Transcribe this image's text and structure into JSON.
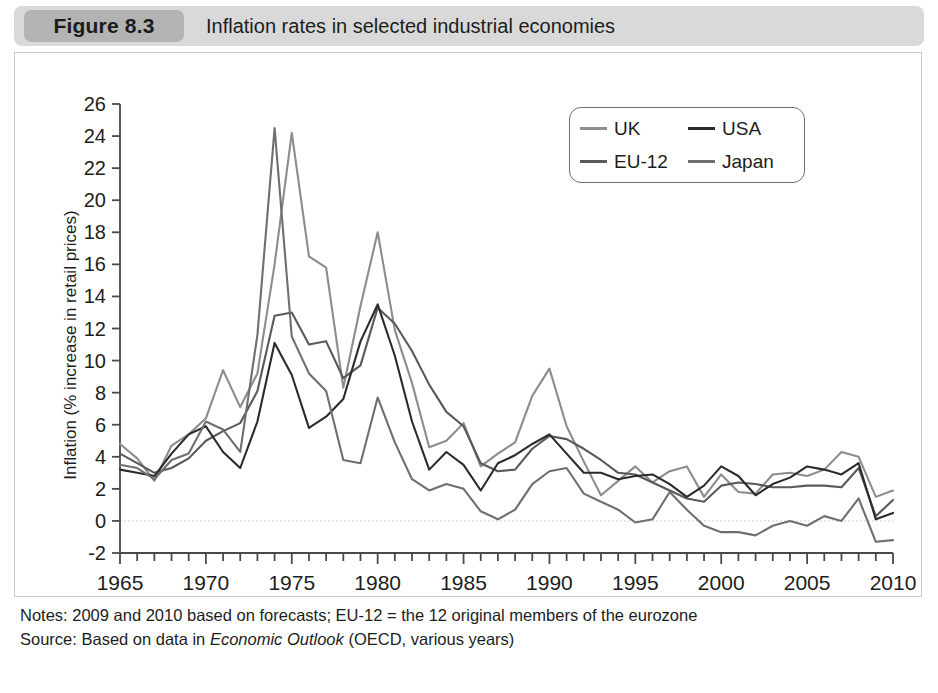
{
  "header": {
    "badge": "Figure 8.3",
    "title": "Inflation rates in selected industrial economies"
  },
  "footnotes": {
    "notes_prefix": "Notes: 2009 and 2010 based on forecasts; EU-12 = the 12 original members of the eurozone",
    "source_prefix": "Source: Based on data in ",
    "source_italic": "Economic Outlook",
    "source_suffix": " (OECD, various years)"
  },
  "colors": {
    "uk": "#8c8c8c",
    "eu12": "#595959",
    "usa": "#2b2b2b",
    "japan": "#6f6f6f",
    "axis": "#4a4a4a",
    "zero_gridline": "#cfcfcf",
    "panel_border": "#c9c9c9",
    "header_bar": "#d9d9d9",
    "badge": "#b3b3b3"
  },
  "chart_data": {
    "type": "line",
    "title": "Inflation rates in selected industrial economies",
    "xlabel": "",
    "ylabel": "Inflation (% increase in retail prices)",
    "xlim": [
      1965,
      2010
    ],
    "ylim": [
      -2,
      26
    ],
    "ytick_step": 2,
    "yticks": [
      -2,
      0,
      2,
      4,
      6,
      8,
      10,
      12,
      14,
      16,
      18,
      20,
      22,
      24,
      26
    ],
    "xticks_labeled": [
      1965,
      1970,
      1975,
      1980,
      1985,
      1990,
      1995,
      2000,
      2005,
      2010
    ],
    "xtick_minor_step": 1,
    "grid": "zero-line-only",
    "legend_position": "top-right",
    "x": [
      1965,
      1966,
      1967,
      1968,
      1969,
      1970,
      1971,
      1972,
      1973,
      1974,
      1975,
      1976,
      1977,
      1978,
      1979,
      1980,
      1981,
      1982,
      1983,
      1984,
      1985,
      1986,
      1987,
      1988,
      1989,
      1990,
      1991,
      1992,
      1993,
      1994,
      1995,
      1996,
      1997,
      1998,
      1999,
      2000,
      2001,
      2002,
      2003,
      2004,
      2005,
      2006,
      2007,
      2008,
      2009,
      2010
    ],
    "series": [
      {
        "name": "UK",
        "color": "#8c8c8c",
        "values": [
          4.8,
          3.9,
          2.5,
          4.7,
          5.4,
          6.4,
          9.4,
          7.1,
          9.2,
          16.0,
          24.2,
          16.5,
          15.8,
          8.3,
          13.4,
          18.0,
          11.9,
          8.6,
          4.6,
          5.0,
          6.1,
          3.4,
          4.2,
          4.9,
          7.8,
          9.5,
          5.9,
          3.7,
          1.6,
          2.5,
          3.4,
          2.4,
          3.1,
          3.4,
          1.5,
          2.9,
          1.8,
          1.7,
          2.9,
          3.0,
          2.8,
          3.2,
          4.3,
          4.0,
          1.5,
          1.9
        ]
      },
      {
        "name": "EU-12",
        "color": "#595959",
        "values": [
          4.2,
          3.6,
          3.0,
          3.3,
          3.9,
          5.0,
          5.6,
          6.1,
          8.1,
          12.8,
          13.0,
          11.0,
          11.2,
          8.9,
          9.7,
          13.3,
          12.3,
          10.6,
          8.5,
          6.8,
          5.9,
          3.6,
          3.1,
          3.2,
          4.5,
          5.3,
          5.1,
          4.5,
          3.8,
          3.0,
          2.9,
          2.4,
          1.9,
          1.4,
          1.2,
          2.2,
          2.4,
          2.3,
          2.1,
          2.1,
          2.2,
          2.2,
          2.1,
          3.3,
          0.3,
          1.3
        ]
      },
      {
        "name": "USA",
        "color": "#2b2b2b",
        "values": [
          3.2,
          3.0,
          2.8,
          4.2,
          5.4,
          5.9,
          4.3,
          3.3,
          6.2,
          11.1,
          9.1,
          5.8,
          6.5,
          7.6,
          11.2,
          13.5,
          10.3,
          6.2,
          3.2,
          4.3,
          3.5,
          1.9,
          3.6,
          4.1,
          4.8,
          5.4,
          4.2,
          3.0,
          3.0,
          2.6,
          2.8,
          2.9,
          2.3,
          1.5,
          2.2,
          3.4,
          2.8,
          1.6,
          2.3,
          2.7,
          3.4,
          3.2,
          2.9,
          3.6,
          0.1,
          0.5
        ]
      },
      {
        "name": "Japan",
        "color": "#6f6f6f",
        "values": [
          3.5,
          3.3,
          2.6,
          3.8,
          4.2,
          6.2,
          5.7,
          4.3,
          11.6,
          24.5,
          11.5,
          9.2,
          8.1,
          3.8,
          3.6,
          7.7,
          4.9,
          2.6,
          1.9,
          2.3,
          2.0,
          0.6,
          0.1,
          0.7,
          2.3,
          3.1,
          3.3,
          1.7,
          1.2,
          0.7,
          -0.1,
          0.1,
          1.8,
          0.7,
          -0.3,
          -0.7,
          -0.7,
          -0.9,
          -0.3,
          0.0,
          -0.3,
          0.3,
          0.0,
          1.4,
          -1.3,
          -1.2
        ]
      }
    ]
  },
  "legend": {
    "items": [
      {
        "label": "UK",
        "color_key": "uk"
      },
      {
        "label": "USA",
        "color_key": "usa"
      },
      {
        "label": "EU-12",
        "color_key": "eu12"
      },
      {
        "label": "Japan",
        "color_key": "japan"
      }
    ]
  }
}
